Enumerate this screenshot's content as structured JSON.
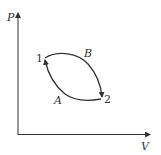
{
  "diagram": {
    "type": "pv-cycle",
    "axes": {
      "y_label": "P",
      "x_label": "V"
    },
    "points": [
      {
        "id": "1",
        "label": "1"
      },
      {
        "id": "2",
        "label": "2"
      }
    ],
    "paths": [
      {
        "id": "B",
        "label": "B",
        "from": "1",
        "to": "2",
        "shape": "upper curve"
      },
      {
        "id": "A",
        "label": "A",
        "from": "2",
        "to": "1",
        "shape": "lower curve"
      }
    ],
    "colors": {
      "line": "#333333",
      "background": "#ffffff"
    }
  }
}
